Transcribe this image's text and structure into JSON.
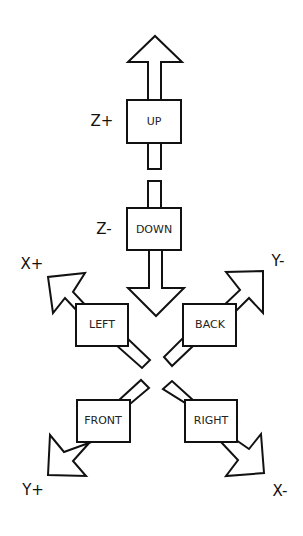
{
  "diagram": {
    "title": "",
    "directions": [
      {
        "id": "up",
        "label": "UP",
        "axis": "Z+"
      },
      {
        "id": "down",
        "label": "DOWN",
        "axis": "Z-"
      },
      {
        "id": "left",
        "label": "LEFT",
        "axis": "X+"
      },
      {
        "id": "back",
        "label": "BACK",
        "axis": "Y-"
      },
      {
        "id": "front",
        "label": "FRONT",
        "axis": "Y+"
      },
      {
        "id": "right",
        "label": "RIGHT",
        "axis": "X-"
      }
    ],
    "colors": {
      "stroke": "#111111",
      "fill": "#ffffff",
      "background": "#ffffff"
    }
  }
}
